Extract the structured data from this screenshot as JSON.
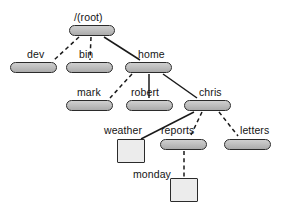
{
  "diagram": {
    "type": "filesystem-tree",
    "background_color": "#ffffff",
    "styles": {
      "directory_fill": "#bdbdbd",
      "directory_stroke": "#2b2b2b",
      "file_fill": "#ececec",
      "file_stroke": "#2b2b2b",
      "edge_color": "#1a1a1a",
      "label_color": "#141414"
    },
    "legend": {
      "directory_shape": "rounded-rectangle",
      "file_shape": "square"
    },
    "nodes": [
      {
        "id": "root",
        "label": "/(root)",
        "kind": "directory",
        "shape": "rounded-rectangle",
        "x": 69,
        "y": 25,
        "w": 46,
        "h": 11,
        "label_x": 74,
        "label_y": 12
      },
      {
        "id": "dev",
        "label": "dev",
        "kind": "directory",
        "shape": "rounded-rectangle",
        "x": 10,
        "y": 62,
        "w": 47,
        "h": 11,
        "label_x": 27,
        "label_y": 49
      },
      {
        "id": "bin",
        "label": "bin",
        "kind": "directory",
        "shape": "rounded-rectangle",
        "x": 66,
        "y": 62,
        "w": 47,
        "h": 11,
        "label_x": 79,
        "label_y": 49
      },
      {
        "id": "home",
        "label": "home",
        "kind": "directory",
        "shape": "rounded-rectangle",
        "x": 125,
        "y": 62,
        "w": 47,
        "h": 11,
        "label_x": 138,
        "label_y": 49
      },
      {
        "id": "mark",
        "label": "mark",
        "kind": "directory",
        "shape": "rounded-rectangle",
        "x": 66,
        "y": 100,
        "w": 47,
        "h": 11,
        "label_x": 77,
        "label_y": 87
      },
      {
        "id": "robert",
        "label": "robert",
        "kind": "directory",
        "shape": "rounded-rectangle",
        "x": 126,
        "y": 100,
        "w": 47,
        "h": 11,
        "label_x": 131,
        "label_y": 87
      },
      {
        "id": "chris",
        "label": "chris",
        "kind": "directory",
        "shape": "rounded-rectangle",
        "x": 184,
        "y": 100,
        "w": 47,
        "h": 11,
        "label_x": 199,
        "label_y": 87
      },
      {
        "id": "weather",
        "label": "weather",
        "kind": "file",
        "shape": "square",
        "x": 117,
        "y": 139,
        "w": 28,
        "h": 24,
        "label_x": 104,
        "label_y": 125
      },
      {
        "id": "reports",
        "label": "reports",
        "kind": "directory",
        "shape": "rounded-rectangle",
        "x": 160,
        "y": 139,
        "w": 47,
        "h": 11,
        "label_x": 161,
        "label_y": 125
      },
      {
        "id": "letters",
        "label": "letters",
        "kind": "directory",
        "shape": "rounded-rectangle",
        "x": 224,
        "y": 139,
        "w": 47,
        "h": 11,
        "label_x": 240,
        "label_y": 125
      },
      {
        "id": "monday",
        "label": "monday",
        "kind": "file",
        "shape": "square",
        "x": 170,
        "y": 178,
        "w": 28,
        "h": 24,
        "label_x": 133,
        "label_y": 169
      }
    ],
    "edges": [
      {
        "id": "root-dev",
        "from": "root",
        "to": "dev",
        "style": "dashed",
        "x1": 79,
        "y1": 37,
        "x2": 54,
        "y2": 60
      },
      {
        "id": "root-bin",
        "from": "root",
        "to": "bin",
        "style": "dashed",
        "x1": 91,
        "y1": 37,
        "x2": 90,
        "y2": 60
      },
      {
        "id": "root-home",
        "from": "root",
        "to": "home",
        "style": "solid",
        "x1": 104,
        "y1": 37,
        "x2": 140,
        "y2": 60
      },
      {
        "id": "home-mark",
        "from": "home",
        "to": "mark",
        "style": "dashed",
        "x1": 132,
        "y1": 74,
        "x2": 110,
        "y2": 98
      },
      {
        "id": "home-robert",
        "from": "home",
        "to": "robert",
        "style": "solid",
        "x1": 149,
        "y1": 74,
        "x2": 149,
        "y2": 98
      },
      {
        "id": "home-chris",
        "from": "home",
        "to": "chris",
        "style": "solid",
        "x1": 163,
        "y1": 74,
        "x2": 197,
        "y2": 98
      },
      {
        "id": "chris-weather",
        "from": "chris",
        "to": "weather",
        "style": "solid",
        "x1": 194,
        "y1": 112,
        "x2": 141,
        "y2": 139
      },
      {
        "id": "chris-reports",
        "from": "chris",
        "to": "reports",
        "style": "dashed",
        "x1": 202,
        "y1": 112,
        "x2": 191,
        "y2": 135
      },
      {
        "id": "chris-letters",
        "from": "chris",
        "to": "letters",
        "style": "dashed",
        "x1": 219,
        "y1": 112,
        "x2": 238,
        "y2": 136
      },
      {
        "id": "reports-monday",
        "from": "reports",
        "to": "monday",
        "style": "dashed",
        "x1": 184,
        "y1": 151,
        "x2": 184,
        "y2": 178
      }
    ]
  }
}
